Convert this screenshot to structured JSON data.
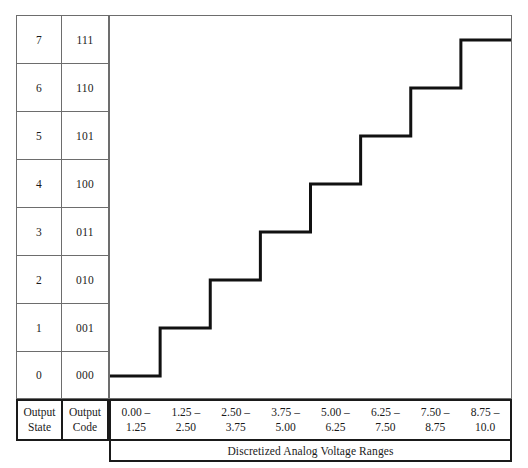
{
  "figure": {
    "caption": "Discretized Analog Voltage Ranges",
    "line_color": "#111111",
    "grid_color": "#6d6d6d",
    "frame_color": "#1a1a1a"
  },
  "table": {
    "header": {
      "state_line1": "Output",
      "state_line2": "State",
      "code_line1": "Output",
      "code_line2": "Code"
    },
    "rows": [
      {
        "state": "7",
        "code": "111"
      },
      {
        "state": "6",
        "code": "110"
      },
      {
        "state": "5",
        "code": "101"
      },
      {
        "state": "4",
        "code": "100"
      },
      {
        "state": "3",
        "code": "011"
      },
      {
        "state": "2",
        "code": "010"
      },
      {
        "state": "1",
        "code": "001"
      },
      {
        "state": "0",
        "code": "000"
      }
    ]
  },
  "x_ranges": [
    {
      "low": "0.00 –",
      "high": "1.25"
    },
    {
      "low": "1.25 –",
      "high": "2.50"
    },
    {
      "low": "2.50 –",
      "high": "3.75"
    },
    {
      "low": "3.75 –",
      "high": "5.00"
    },
    {
      "low": "5.00 –",
      "high": "6.25"
    },
    {
      "low": "6.25 –",
      "high": "7.50"
    },
    {
      "low": "7.50 –",
      "high": "8.75"
    },
    {
      "low": "8.75 –",
      "high": "10.0"
    }
  ],
  "chart_data": {
    "type": "line",
    "title": "Discretized Analog Voltage Ranges",
    "xlabel": "Discretized Analog Voltage Ranges",
    "ylabel": "Output State",
    "style": "staircase",
    "xlim": [
      0.0,
      10.0
    ],
    "ylim": [
      0,
      7
    ],
    "grid": false,
    "legend": null,
    "categories": [
      "0.00 – 1.25",
      "1.25 – 2.50",
      "2.50 – 3.75",
      "3.75 – 5.00",
      "5.00 – 6.25",
      "6.25 – 7.50",
      "7.50 – 8.75",
      "8.75 – 10.0"
    ],
    "values": [
      0,
      1,
      2,
      3,
      4,
      5,
      6,
      7
    ],
    "output_codes": [
      "000",
      "001",
      "010",
      "011",
      "100",
      "101",
      "110",
      "111"
    ],
    "x_breakpoints": [
      0.0,
      1.25,
      2.5,
      3.75,
      5.0,
      6.25,
      7.5,
      8.75,
      10.0
    ],
    "series": [
      {
        "name": "ADC transfer function",
        "values": [
          0,
          1,
          2,
          3,
          4,
          5,
          6,
          7
        ]
      }
    ]
  }
}
